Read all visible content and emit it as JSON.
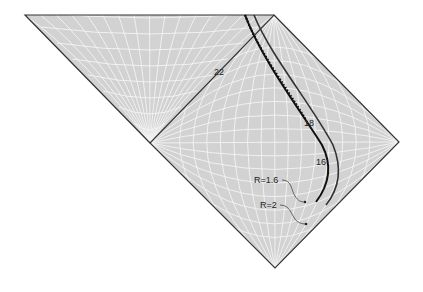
{
  "diagram": {
    "type": "penrose-diagram",
    "colors": {
      "fill": "#d2d2d2",
      "grid": "#f4f4f4",
      "edge": "#333333",
      "curve": "#111111",
      "background": "#ffffff"
    },
    "regions": [
      {
        "name": "upper-triangle",
        "points": [
          [
            25,
            15
          ],
          [
            274,
            15
          ],
          [
            150,
            143
          ]
        ]
      },
      {
        "name": "diamond",
        "points": [
          [
            274,
            15
          ],
          [
            399,
            142
          ],
          [
            275,
            268
          ],
          [
            150,
            143
          ]
        ]
      }
    ],
    "curve_labels": [
      {
        "text": "22",
        "x": 214,
        "y": 75
      },
      {
        "text": "18",
        "x": 304,
        "y": 126
      },
      {
        "text": "16",
        "x": 316,
        "y": 165
      }
    ],
    "annotations": [
      {
        "text": "R=1.6",
        "x": 254,
        "y": 183,
        "target": [
          305,
          202
        ]
      },
      {
        "text": "R=2",
        "x": 260,
        "y": 208,
        "target": [
          306,
          224
        ]
      }
    ]
  }
}
